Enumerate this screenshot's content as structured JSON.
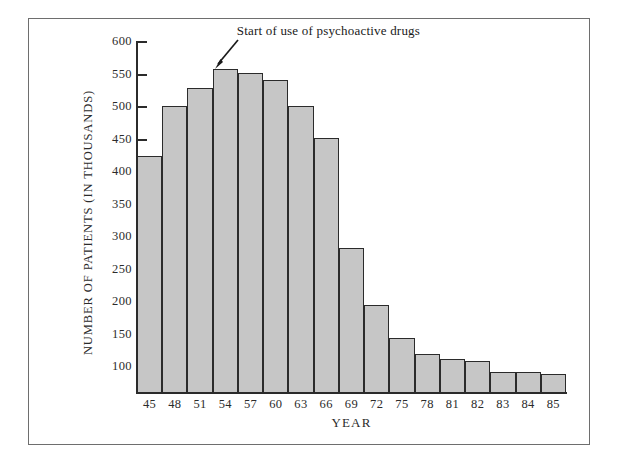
{
  "chart_data": {
    "type": "bar",
    "title": "",
    "xlabel": "YEAR",
    "ylabel": "NUMBER OF PATIENTS (IN THOUSANDS)",
    "categories": [
      "45",
      "48",
      "51",
      "54",
      "57",
      "60",
      "63",
      "66",
      "69",
      "72",
      "75",
      "78",
      "81",
      "82",
      "83",
      "84",
      "85"
    ],
    "values": [
      425,
      501,
      529,
      559,
      552,
      541,
      502,
      453,
      283,
      195,
      145,
      120,
      113,
      110,
      92,
      92,
      89
    ],
    "ylim": [
      60,
      600
    ],
    "ytick_values": [
      100,
      150,
      200,
      250,
      300,
      350,
      400,
      450,
      500,
      550,
      600
    ],
    "ytick_labels": [
      "100",
      "150",
      "200",
      "250",
      "300",
      "350",
      "400",
      "450",
      "500",
      "550",
      "600"
    ],
    "grid": false,
    "legend": "none",
    "annotations": [
      {
        "text": "Start of use of psychoactive drugs",
        "points_at_category": "54",
        "points_at_value": 559
      }
    ],
    "colors": {
      "bar_fill": "#c6c6c6",
      "bar_edge": "#2b2b2b",
      "axis": "#2b2b2b",
      "text": "#1a1a1a",
      "frame": "#6e6e6e",
      "background": "#ffffff"
    }
  }
}
